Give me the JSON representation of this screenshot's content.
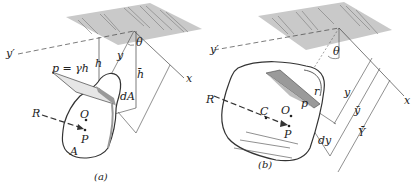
{
  "figure": {
    "colors": {
      "surface": "#c9c9c9",
      "hatch": "#7a7a7a",
      "outline": "#333333",
      "line": "#444444",
      "shade": "#9a9a9a"
    },
    "panel_a": {
      "caption": "(a)",
      "labels": {
        "y_prime": "y′",
        "theta": "θ",
        "y": "y",
        "h": "h",
        "h_bar": "h̄",
        "x": "x",
        "pressure": "p = γh",
        "dA": "dA",
        "R": "R",
        "O": "O",
        "P": "P",
        "A": "A"
      }
    },
    "panel_b": {
      "caption": "(b)",
      "labels": {
        "y_prime": "y′",
        "theta": "θ",
        "x": "x",
        "y": "y",
        "y_bar": "ȳ",
        "Y_bar": "Ȳ",
        "R": "R",
        "C": "C",
        "O": "O",
        "P": "P",
        "p": "p",
        "r": "r",
        "dy": "dy"
      }
    }
  }
}
